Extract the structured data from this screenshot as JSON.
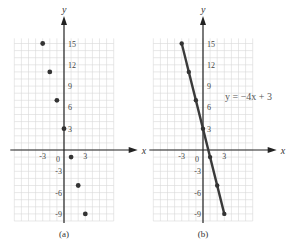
{
  "chart_data": [
    {
      "type": "scatter",
      "panel_label": "(a)",
      "xlabel": "x",
      "ylabel": "y",
      "x_ticks": [
        -3,
        0,
        3
      ],
      "y_ticks": [
        15,
        12,
        9,
        6,
        3,
        -3,
        -6,
        -9
      ],
      "x_tick_labels": [
        "-3",
        "0",
        "3"
      ],
      "y_tick_labels": [
        "15",
        "12",
        "9",
        "6",
        "3",
        "-3",
        "-6",
        "-9"
      ],
      "xlim": [
        -7,
        7
      ],
      "ylim": [
        -10,
        16
      ],
      "grid": true,
      "points": [
        {
          "x": -3,
          "y": 15
        },
        {
          "x": -2,
          "y": 11
        },
        {
          "x": -1,
          "y": 7
        },
        {
          "x": 0,
          "y": 3
        },
        {
          "x": 1,
          "y": -1
        },
        {
          "x": 2,
          "y": -5
        },
        {
          "x": 3,
          "y": -9
        }
      ]
    },
    {
      "type": "line",
      "panel_label": "(b)",
      "xlabel": "x",
      "ylabel": "y",
      "x_ticks": [
        -3,
        0,
        3
      ],
      "y_ticks": [
        15,
        12,
        9,
        6,
        3,
        -3,
        -6,
        -9
      ],
      "x_tick_labels": [
        "-3",
        "0",
        "3"
      ],
      "y_tick_labels": [
        "15",
        "12",
        "9",
        "6",
        "3",
        "-3",
        "-6",
        "-9"
      ],
      "xlim": [
        -7,
        7
      ],
      "ylim": [
        -10,
        16
      ],
      "grid": true,
      "annotation": "y = −4x + 3",
      "points": [
        {
          "x": -3,
          "y": 15
        },
        {
          "x": -2,
          "y": 11
        },
        {
          "x": -1,
          "y": 7
        },
        {
          "x": 0,
          "y": 3
        },
        {
          "x": 1,
          "y": -1
        },
        {
          "x": 2,
          "y": -5
        },
        {
          "x": 3,
          "y": -9
        }
      ]
    }
  ],
  "captions": {
    "a": "(a)",
    "b": "(b)"
  },
  "axis_labels": {
    "x": "x",
    "y": "y"
  },
  "equation": "y = −4x + 3",
  "colors": {
    "grid": "#d8d8d8",
    "axis": "#222222",
    "point": "#333333",
    "line": "#3a3a3a"
  }
}
